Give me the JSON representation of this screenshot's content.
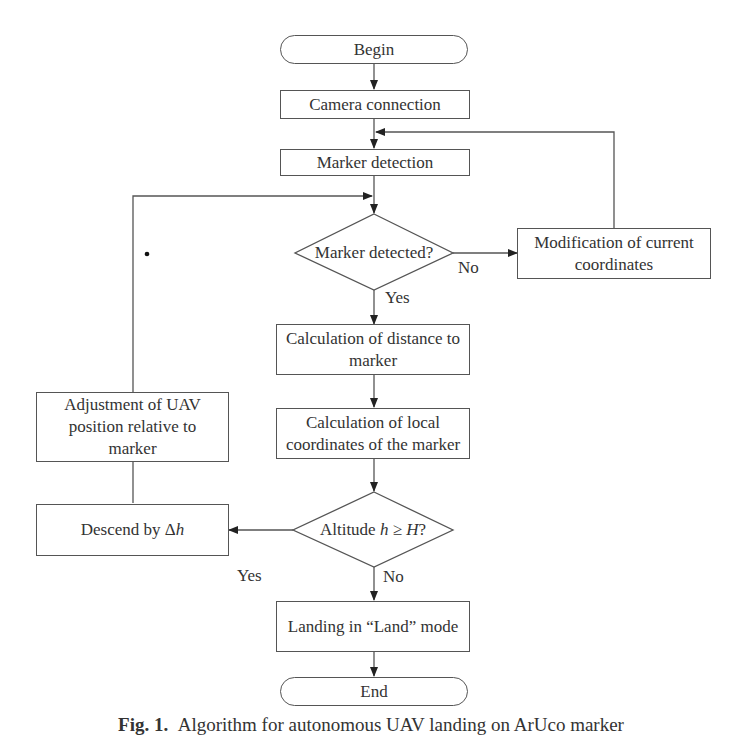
{
  "flowchart": {
    "nodes": {
      "begin": "Begin",
      "camera_connection": "Camera connection",
      "marker_detection": "Marker detection",
      "marker_detected": "Marker detected?",
      "modification": "Modification of current coordinates",
      "calc_distance": "Calculation of distance to marker",
      "calc_local": "Calculation of local coordinates of the marker",
      "altitude_check_prefix": "Altitude ",
      "altitude_check_h": "h",
      "altitude_check_op": " ≥ ",
      "altitude_check_H": "H",
      "altitude_check_suffix": "?",
      "descend_prefix": "Descend by Δ",
      "descend_var": "h",
      "adjustment": "Adjustment of UAV position relative to marker",
      "landing": "Landing in “Land” mode",
      "end": "End"
    },
    "edge_labels": {
      "marker_no": "No",
      "marker_yes": "Yes",
      "altitude_yes": "Yes",
      "altitude_no": "No"
    }
  },
  "caption": {
    "prefix": "Fig. 1.",
    "text": "Algorithm for autonomous UAV landing on ArUco marker"
  }
}
